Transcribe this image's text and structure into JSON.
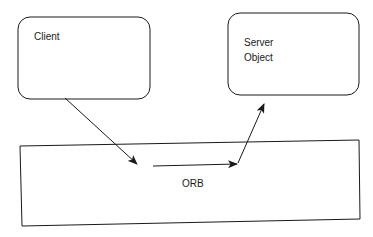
{
  "diagram": {
    "nodes": [
      {
        "id": "client",
        "label_lines": [
          "Client"
        ],
        "shape": "rounded-rectangle"
      },
      {
        "id": "server",
        "label_lines": [
          "Server",
          "Object"
        ],
        "shape": "rounded-rectangle"
      },
      {
        "id": "orb",
        "label_lines": [
          "ORB"
        ],
        "shape": "rectangle"
      }
    ],
    "edges": [
      {
        "from": "client",
        "to": "orb",
        "description": "request enters ORB"
      },
      {
        "from": "orb",
        "to": "orb",
        "description": "request passes through ORB"
      },
      {
        "from": "orb",
        "to": "server",
        "description": "request delivered to server object"
      }
    ],
    "colors": {
      "stroke": "#1a1a1a",
      "background": "#ffffff"
    }
  }
}
